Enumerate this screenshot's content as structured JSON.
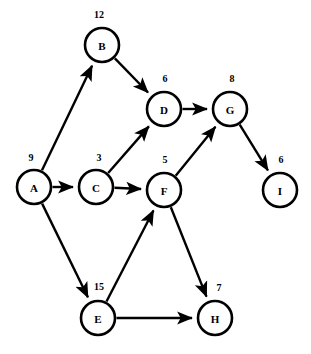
{
  "diagram": {
    "type": "directed-graph",
    "width": 311,
    "height": 354,
    "background_color": "#ffffff",
    "stroke_color": "#000000",
    "node_radius": 17,
    "nodes": [
      {
        "id": "A",
        "label": "A",
        "cx": 34,
        "cy": 187,
        "weight": "9",
        "wx": 31,
        "wy": 157
      },
      {
        "id": "B",
        "label": "B",
        "cx": 102,
        "cy": 45,
        "weight": "12",
        "wx": 99,
        "wy": 14
      },
      {
        "id": "C",
        "label": "C",
        "cx": 96,
        "cy": 187,
        "weight": "3",
        "wx": 99,
        "wy": 157
      },
      {
        "id": "D",
        "label": "D",
        "cx": 164,
        "cy": 109,
        "weight": "6",
        "wx": 165,
        "wy": 78
      },
      {
        "id": "E",
        "label": "E",
        "cx": 98,
        "cy": 318,
        "weight": "15",
        "wx": 99,
        "wy": 286
      },
      {
        "id": "F",
        "label": "F",
        "cx": 164,
        "cy": 190,
        "weight": "5",
        "wx": 165,
        "wy": 159
      },
      {
        "id": "G",
        "label": "G",
        "cx": 230,
        "cy": 109,
        "weight": "8",
        "wx": 232,
        "wy": 78
      },
      {
        "id": "H",
        "label": "H",
        "cx": 215,
        "cy": 318,
        "weight": "7",
        "wx": 219,
        "wy": 287
      },
      {
        "id": "I",
        "label": "I",
        "cx": 280,
        "cy": 190,
        "weight": "6",
        "wx": 281,
        "wy": 159
      }
    ],
    "edges": [
      {
        "from": "A",
        "to": "B",
        "directed": true
      },
      {
        "from": "A",
        "to": "C",
        "directed": true
      },
      {
        "from": "A",
        "to": "E",
        "directed": true
      },
      {
        "from": "B",
        "to": "D",
        "directed": true
      },
      {
        "from": "C",
        "to": "D",
        "directed": true
      },
      {
        "from": "C",
        "to": "F",
        "directed": true
      },
      {
        "from": "D",
        "to": "G",
        "directed": true
      },
      {
        "from": "E",
        "to": "F",
        "directed": true
      },
      {
        "from": "E",
        "to": "H",
        "directed": true
      },
      {
        "from": "F",
        "to": "G",
        "directed": true
      },
      {
        "from": "F",
        "to": "H",
        "directed": true
      },
      {
        "from": "G",
        "to": "I",
        "directed": true
      }
    ]
  }
}
